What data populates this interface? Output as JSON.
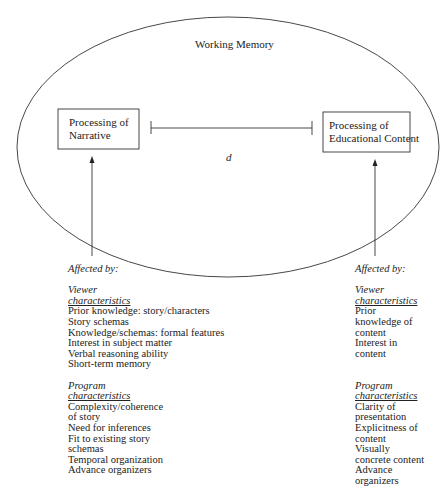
{
  "diagram": {
    "ellipse_label": "Working Memory",
    "left_box": {
      "line1": "Processing of",
      "line2": "Narrative"
    },
    "right_box": {
      "line1": "Processing of",
      "line2": "Educational Content"
    },
    "distance_label": "d",
    "left_column": {
      "affected_by": "Affected by:",
      "viewer_heading_1": "Viewer",
      "viewer_heading_2": "characteristics",
      "viewer_items": [
        "Prior knowledge: story/characters",
        "Story schemas",
        "Knowledge/schemas: formal features",
        "Interest in subject matter",
        "Verbal reasoning ability",
        "Short-term memory"
      ],
      "program_heading_1": "Program",
      "program_heading_2": "characteristics",
      "program_items": [
        "Complexity/coherence",
        "of story",
        "Need for inferences",
        "Fit to existing story",
        "schemas",
        "Temporal organization",
        "Advance organizers"
      ]
    },
    "right_column": {
      "affected_by": "Affected by:",
      "viewer_heading_1": "Viewer",
      "viewer_heading_2": "characteristics",
      "viewer_items": [
        "Prior",
        "knowledge of",
        "content",
        "Interest in",
        "content"
      ],
      "program_heading_1": "Program",
      "program_heading_2": "characteristics",
      "program_items": [
        "Clarity of",
        "presentation",
        "Explicitness of",
        "content",
        "Visually",
        "concrete content",
        "Advance",
        "organizers"
      ]
    }
  }
}
